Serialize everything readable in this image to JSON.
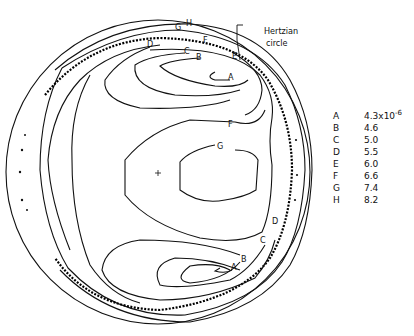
{
  "annotation": {
    "line1": "Hertzian",
    "line2": "circle"
  },
  "contour_labels": {
    "A": "A",
    "B": "B",
    "C": "C",
    "D": "D",
    "E": "E",
    "F": "F",
    "G": "G",
    "H": "H"
  },
  "legend": [
    {
      "key": "A",
      "value": "4.3x10",
      "exp": "-6"
    },
    {
      "key": "B",
      "value": "4.6"
    },
    {
      "key": "C",
      "value": "5.0"
    },
    {
      "key": "D",
      "value": "5.5"
    },
    {
      "key": "E",
      "value": "6.0"
    },
    {
      "key": "F",
      "value": "6.6"
    },
    {
      "key": "G",
      "value": "7.4"
    },
    {
      "key": "H",
      "value": "8.2"
    }
  ]
}
